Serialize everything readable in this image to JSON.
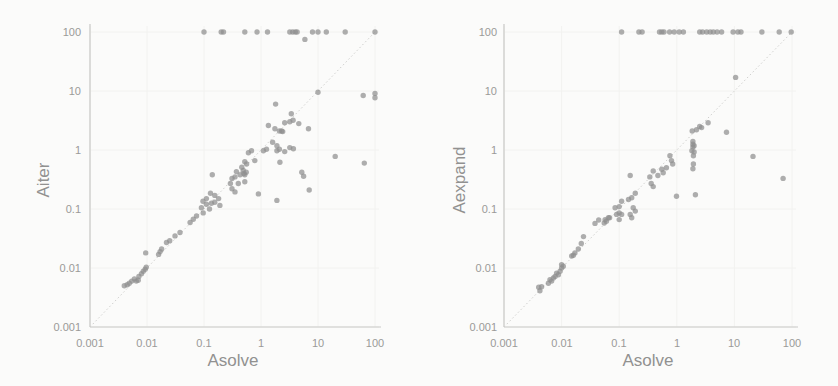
{
  "figure": {
    "background": "#fbfbfa"
  },
  "style": {
    "point_color": "#8f8f8f",
    "point_opacity": 0.72,
    "point_radius": 2.7,
    "axis_color": "#c9c9c7",
    "diagonal_color": "#cfcfcd",
    "grid_color": "#f2f2f0",
    "label_color": "#9a9a98"
  },
  "chart_data": [
    {
      "type": "scatter",
      "title": "",
      "xlabel": "Asolve",
      "ylabel": "Aiter",
      "xscale": "log",
      "yscale": "log",
      "xlim": [
        0.001,
        100
      ],
      "ylim": [
        0.001,
        100
      ],
      "grid": "faint decade gridlines",
      "x_ticks": [
        "0.001",
        "0.01",
        "0.1",
        "1",
        "10",
        "100"
      ],
      "y_ticks": [
        "0.001",
        "0.01",
        "0.1",
        "1",
        "10",
        "100"
      ],
      "diagonal_identity_line": true,
      "series": [
        {
          "name": "points",
          "points": [
            [
              0.004,
              0.005
            ],
            [
              0.0045,
              0.0052
            ],
            [
              0.0049,
              0.0055
            ],
            [
              0.0054,
              0.006
            ],
            [
              0.006,
              0.0065
            ],
            [
              0.0065,
              0.006
            ],
            [
              0.007,
              0.0062
            ],
            [
              0.0072,
              0.0072
            ],
            [
              0.008,
              0.008
            ],
            [
              0.0086,
              0.0088
            ],
            [
              0.0093,
              0.0095
            ],
            [
              0.0097,
              0.0103
            ],
            [
              0.0095,
              0.018
            ],
            [
              0.016,
              0.017
            ],
            [
              0.017,
              0.019
            ],
            [
              0.018,
              0.021
            ],
            [
              0.022,
              0.027
            ],
            [
              0.025,
              0.029
            ],
            [
              0.031,
              0.035
            ],
            [
              0.038,
              0.04
            ],
            [
              0.057,
              0.059
            ],
            [
              0.065,
              0.067
            ],
            [
              0.074,
              0.076
            ],
            [
              0.09,
              0.105
            ],
            [
              0.096,
              0.135
            ],
            [
              0.097,
              0.086
            ],
            [
              0.11,
              0.12
            ],
            [
              0.11,
              0.15
            ],
            [
              0.125,
              0.1
            ],
            [
              0.13,
              0.185
            ],
            [
              0.135,
              0.125
            ],
            [
              0.14,
              0.38
            ],
            [
              0.155,
              0.13
            ],
            [
              0.155,
              0.17
            ],
            [
              0.18,
              0.15
            ],
            [
              0.19,
              0.115
            ],
            [
              0.29,
              0.27
            ],
            [
              0.31,
              0.22
            ],
            [
              0.31,
              0.33
            ],
            [
              0.35,
              0.195
            ],
            [
              0.35,
              0.35
            ],
            [
              0.37,
              0.43
            ],
            [
              0.4,
              0.27
            ],
            [
              0.43,
              0.38
            ],
            [
              0.46,
              0.51
            ],
            [
              0.49,
              0.45
            ],
            [
              0.5,
              0.4
            ],
            [
              0.52,
              0.29
            ],
            [
              0.52,
              0.38
            ],
            [
              0.52,
              0.63
            ],
            [
              0.55,
              0.42
            ],
            [
              0.56,
              0.58
            ],
            [
              0.6,
              0.9
            ],
            [
              0.68,
              0.97
            ],
            [
              0.78,
              0.66
            ],
            [
              0.9,
              0.18
            ],
            [
              1.1,
              0.97
            ],
            [
              1.25,
              1.03
            ],
            [
              1.35,
              2.6
            ],
            [
              1.6,
              1.35
            ],
            [
              1.75,
              2.3
            ],
            [
              1.8,
              6
            ],
            [
              1.9,
              0.14
            ],
            [
              1.9,
              0.97
            ],
            [
              1.9,
              1.18
            ],
            [
              2.1,
              1.03
            ],
            [
              2.1,
              2.1
            ],
            [
              2.15,
              0.62
            ],
            [
              2.3,
              2.1
            ],
            [
              2.4,
              2.05
            ],
            [
              2.6,
              0.94
            ],
            [
              2.6,
              2.9
            ],
            [
              3.2,
              1.1
            ],
            [
              3.2,
              3
            ],
            [
              3.4,
              4.1
            ],
            [
              3.65,
              3.2
            ],
            [
              3.7,
              1.05
            ],
            [
              4.6,
              2.8
            ],
            [
              5.2,
              0.42
            ],
            [
              5.6,
              0.36
            ],
            [
              5.9,
              75
            ],
            [
              6.8,
              2.3
            ],
            [
              7,
              0.21
            ],
            [
              10,
              9.5
            ],
            [
              20,
              0.78
            ],
            [
              62,
              8.4
            ],
            [
              65,
              0.6
            ],
            [
              100,
              9.1
            ],
            [
              100,
              7.7
            ]
          ]
        },
        {
          "name": "capped-at-100",
          "points": [
            [
              0.1,
              100
            ],
            [
              0.2,
              100
            ],
            [
              0.22,
              100
            ],
            [
              0.52,
              100
            ],
            [
              0.85,
              100
            ],
            [
              1.3,
              100
            ],
            [
              3.2,
              100
            ],
            [
              3.6,
              100
            ],
            [
              4,
              100
            ],
            [
              4.3,
              100
            ],
            [
              8,
              100
            ],
            [
              10,
              100
            ],
            [
              14,
              100
            ],
            [
              30,
              100
            ],
            [
              100,
              100
            ]
          ]
        }
      ]
    },
    {
      "type": "scatter",
      "title": "",
      "xlabel": "Asolve",
      "ylabel": "Aexpand",
      "xscale": "log",
      "yscale": "log",
      "xlim": [
        0.001,
        100
      ],
      "ylim": [
        0.001,
        100
      ],
      "grid": "faint decade gridlines",
      "x_ticks": [
        "0.001",
        "0.01",
        "0.1",
        "1",
        "10",
        "100"
      ],
      "y_ticks": [
        "0.001",
        "0.01",
        "0.1",
        "1",
        "10",
        "100"
      ],
      "diagonal_identity_line": true,
      "series": [
        {
          "name": "points",
          "points": [
            [
              0.0042,
              0.0041
            ],
            [
              0.004,
              0.0047
            ],
            [
              0.0045,
              0.0048
            ],
            [
              0.0059,
              0.0055
            ],
            [
              0.0063,
              0.0063
            ],
            [
              0.0067,
              0.006
            ],
            [
              0.0072,
              0.0068
            ],
            [
              0.0077,
              0.0072
            ],
            [
              0.0082,
              0.0082
            ],
            [
              0.0088,
              0.0077
            ],
            [
              0.0094,
              0.0088
            ],
            [
              0.01,
              0.01
            ],
            [
              0.01,
              0.0114
            ],
            [
              0.0107,
              0.0107
            ],
            [
              0.015,
              0.016
            ],
            [
              0.016,
              0.0165
            ],
            [
              0.017,
              0.018
            ],
            [
              0.0195,
              0.021
            ],
            [
              0.022,
              0.026
            ],
            [
              0.024,
              0.034
            ],
            [
              0.038,
              0.057
            ],
            [
              0.044,
              0.065
            ],
            [
              0.055,
              0.058
            ],
            [
              0.057,
              0.066
            ],
            [
              0.06,
              0.062
            ],
            [
              0.065,
              0.071
            ],
            [
              0.068,
              0.071
            ],
            [
              0.085,
              0.105
            ],
            [
              0.09,
              0.081
            ],
            [
              0.1,
              0.066
            ],
            [
              0.1,
              0.086
            ],
            [
              0.1,
              0.11
            ],
            [
              0.11,
              0.081
            ],
            [
              0.11,
              0.135
            ],
            [
              0.145,
              0.145
            ],
            [
              0.155,
              0.081
            ],
            [
              0.155,
              0.37
            ],
            [
              0.165,
              0.071
            ],
            [
              0.165,
              0.155
            ],
            [
              0.175,
              0.105
            ],
            [
              0.19,
              0.092
            ],
            [
              0.19,
              0.185
            ],
            [
              0.34,
              0.35
            ],
            [
              0.36,
              0.27
            ],
            [
              0.39,
              0.24
            ],
            [
              0.39,
              0.44
            ],
            [
              0.47,
              0.37
            ],
            [
              0.55,
              0.47
            ],
            [
              0.58,
              0.41
            ],
            [
              0.66,
              0.5
            ],
            [
              0.76,
              0.8
            ],
            [
              0.81,
              0.66
            ],
            [
              0.85,
              0.58
            ],
            [
              0.99,
              0.165
            ],
            [
              1.83,
              0.97
            ],
            [
              1.85,
              2.1
            ],
            [
              1.9,
              0.48
            ],
            [
              1.94,
              0.58
            ],
            [
              1.94,
              0.8
            ],
            [
              1.9,
              1.13
            ],
            [
              1.9,
              1.25
            ],
            [
              1.9,
              1.4
            ],
            [
              2,
              0.93
            ],
            [
              2,
              1.18
            ],
            [
              2.1,
              0.175
            ],
            [
              2.2,
              2.2
            ],
            [
              2.5,
              2.5
            ],
            [
              2.7,
              2.4
            ],
            [
              3.5,
              2.9
            ],
            [
              7.3,
              2
            ],
            [
              10.5,
              17
            ],
            [
              21,
              0.78
            ],
            [
              70,
              0.33
            ]
          ]
        },
        {
          "name": "capped-at-100",
          "points": [
            [
              0.11,
              100
            ],
            [
              0.22,
              100
            ],
            [
              0.25,
              100
            ],
            [
              0.5,
              100
            ],
            [
              0.55,
              100
            ],
            [
              0.6,
              100
            ],
            [
              0.75,
              100
            ],
            [
              0.9,
              100
            ],
            [
              1.1,
              100
            ],
            [
              1.3,
              100
            ],
            [
              2.5,
              100
            ],
            [
              2.8,
              100
            ],
            [
              3.3,
              100
            ],
            [
              3.8,
              100
            ],
            [
              4.3,
              100
            ],
            [
              5,
              100
            ],
            [
              6,
              100
            ],
            [
              9.5,
              100
            ],
            [
              11.5,
              100
            ],
            [
              13,
              100
            ],
            [
              30,
              100
            ],
            [
              60,
              100
            ],
            [
              97,
              100
            ]
          ]
        }
      ]
    }
  ]
}
